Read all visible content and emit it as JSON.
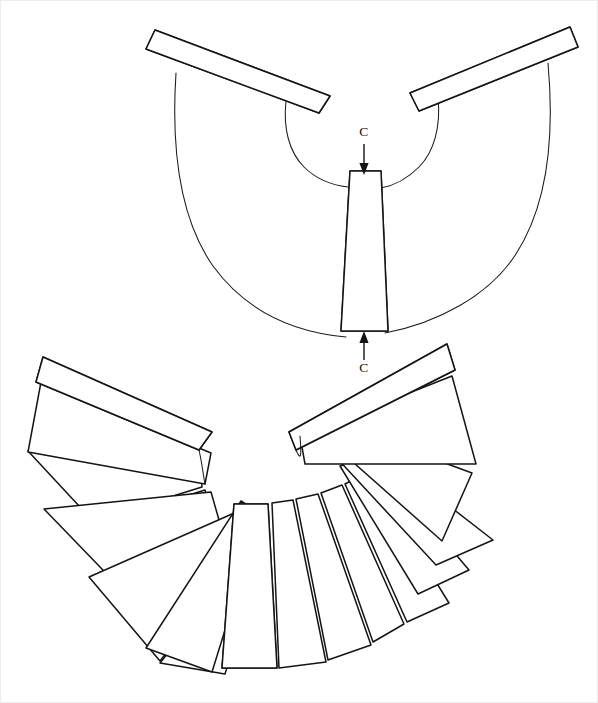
{
  "figure": {
    "canvas": {
      "width": 598,
      "height": 703,
      "background": "#ffffff"
    },
    "line_color": "#141414",
    "fill_color": "#ffffff"
  },
  "callouts": [
    {
      "id": "section-marker-top",
      "label": "C",
      "label_x": 364,
      "label_y": 136,
      "arrow_from_x": 364,
      "arrow_from_y": 144,
      "arrow_to_x": 364,
      "arrow_to_y": 173,
      "direction": "down"
    },
    {
      "id": "section-marker-bottom",
      "label": "C",
      "label_x": 364,
      "label_y": 369,
      "arrow_from_x": 364,
      "arrow_from_y": 360,
      "arrow_to_x": 364,
      "arrow_to_y": 333,
      "direction": "up"
    }
  ],
  "views": [
    {
      "id": "exploded-view",
      "name": "exploded-annular-fan-view",
      "center_x": 365,
      "center_y": 62,
      "inner_radius": 75,
      "outer_radius": 246,
      "segment_count": 3,
      "description": "Upper exploded view: annular band outline with three displaced segments"
    },
    {
      "id": "assembled-view",
      "name": "assembled-annular-fan-view",
      "center_x": 268,
      "center_y": 478,
      "inner_radius": 72,
      "outer_radius": 218,
      "segment_count": 14,
      "description": "Lower assembled view: full radial array of wedge segments"
    }
  ],
  "segments": {
    "patterns": [
      "crosshatch",
      "stipple",
      "diagonal-hatch",
      "plain"
    ],
    "exploded": [
      {
        "index": 0,
        "pattern": "crosshatch",
        "name": "segment-crosshatch-exploded"
      },
      {
        "index": 1,
        "pattern": "stipple",
        "name": "segment-stipple-exploded"
      },
      {
        "index": 2,
        "pattern": "diagonal-hatch",
        "name": "segment-diagonal-hatch-exploded"
      }
    ],
    "assembled": [
      {
        "index": 0,
        "pattern": "crosshatch",
        "name": "segment-crosshatch-assembled"
      },
      {
        "index": 1,
        "pattern": "plain",
        "name": "segment-plain-1"
      },
      {
        "index": 2,
        "pattern": "plain",
        "name": "segment-plain-2"
      },
      {
        "index": 3,
        "pattern": "plain",
        "name": "segment-plain-3"
      },
      {
        "index": 4,
        "pattern": "plain",
        "name": "segment-plain-4"
      },
      {
        "index": 5,
        "pattern": "plain",
        "name": "segment-plain-5"
      },
      {
        "index": 6,
        "pattern": "plain",
        "name": "segment-plain-6"
      },
      {
        "index": 7,
        "pattern": "diagonal-hatch",
        "name": "segment-diagonal-hatch-assembled"
      },
      {
        "index": 8,
        "pattern": "plain",
        "name": "segment-plain-7"
      },
      {
        "index": 9,
        "pattern": "plain",
        "name": "segment-plain-8"
      },
      {
        "index": 10,
        "pattern": "plain",
        "name": "segment-plain-9"
      },
      {
        "index": 11,
        "pattern": "plain",
        "name": "segment-plain-10"
      },
      {
        "index": 12,
        "pattern": "plain",
        "name": "segment-plain-11"
      },
      {
        "index": 13,
        "pattern": "stipple",
        "name": "segment-stipple-assembled"
      }
    ]
  }
}
